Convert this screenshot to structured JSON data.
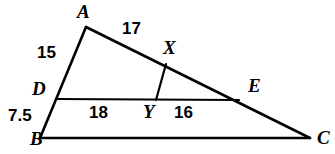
{
  "figure": {
    "type": "geometry-diagram",
    "background_color": "#ffffff",
    "stroke_color": "#000000"
  },
  "points": [
    {
      "name": "A",
      "label": "A",
      "x": 86,
      "y": 27,
      "label_x": 77,
      "label_y": 2
    },
    {
      "name": "B",
      "label": "B",
      "x": 40,
      "y": 138,
      "label_x": 30,
      "label_y": 129
    },
    {
      "name": "C",
      "label": "C",
      "x": 310,
      "y": 138,
      "label_x": 317,
      "label_y": 128
    },
    {
      "name": "D",
      "label": "D",
      "x": 57,
      "y": 99,
      "label_x": 32,
      "label_y": 79
    },
    {
      "name": "E",
      "label": "E",
      "x": 238,
      "y": 99,
      "label_x": 248,
      "label_y": 76
    },
    {
      "name": "X",
      "label": "X",
      "x": 165,
      "y": 65,
      "label_x": 163,
      "label_y": 38
    },
    {
      "name": "Y",
      "label": "Y",
      "x": 156,
      "y": 100,
      "label_x": 143,
      "label_y": 102
    }
  ],
  "segments": [
    {
      "name": "side-AB",
      "from": "A",
      "to": "B",
      "x1": 86,
      "y1": 27,
      "x2": 40,
      "y2": 138,
      "width": 2.6
    },
    {
      "name": "side-AC",
      "from": "A",
      "to": "C",
      "x1": 86,
      "y1": 27,
      "x2": 310,
      "y2": 138,
      "width": 2.6
    },
    {
      "name": "side-BC",
      "from": "B",
      "to": "C",
      "x1": 40,
      "y1": 138,
      "x2": 310,
      "y2": 138,
      "width": 2.6
    },
    {
      "name": "segment-DE",
      "from": "D",
      "to": "E",
      "x1": 57,
      "y1": 99,
      "x2": 239,
      "y2": 100,
      "width": 2.2
    },
    {
      "name": "segment-XY",
      "from": "X",
      "to": "Y",
      "x1": 166,
      "y1": 64,
      "x2": 156,
      "y2": 100,
      "width": 2.2
    }
  ],
  "measures": [
    {
      "name": "measure-AX",
      "value": "17",
      "on_segment": "AC",
      "x": 122,
      "y": 20
    },
    {
      "name": "measure-AD",
      "value": "15",
      "on_segment": "AB",
      "x": 37,
      "y": 44
    },
    {
      "name": "measure-DB",
      "value": "7.5",
      "on_segment": "AB",
      "x": 8,
      "y": 107
    },
    {
      "name": "measure-DY",
      "value": "18",
      "on_segment": "DE",
      "x": 89,
      "y": 104
    },
    {
      "name": "measure-YE",
      "value": "16",
      "on_segment": "DE",
      "x": 174,
      "y": 104
    }
  ]
}
